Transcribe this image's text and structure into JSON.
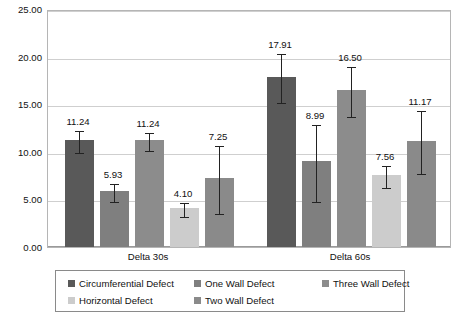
{
  "chart_data": {
    "type": "bar",
    "title": "",
    "xlabel": "",
    "ylabel": "",
    "ylim": [
      0,
      25
    ],
    "yticks": [
      "0.00",
      "5.00",
      "10.00",
      "15.00",
      "20.00",
      "25.00"
    ],
    "ytick_values": [
      0,
      5,
      10,
      15,
      20,
      25
    ],
    "grid": true,
    "legend_position": "bottom",
    "categories": [
      "Delta 30s",
      "Delta 60s"
    ],
    "series": [
      {
        "name": "Circumferential Defect",
        "color": "#595959",
        "texture": "plain",
        "values": [
          11.24,
          17.91
        ],
        "labels": [
          "11.24",
          "17.91"
        ],
        "err_low": [
          1.15,
          2.55
        ],
        "err_high": [
          1.15,
          2.55
        ]
      },
      {
        "name": "One Wall Defect",
        "color": "#7f7f7f",
        "texture": "plain",
        "values": [
          5.93,
          8.99
        ],
        "labels": [
          "5.93",
          "8.99"
        ],
        "err_low": [
          0.95,
          4.05
        ],
        "err_high": [
          0.95,
          4.05
        ]
      },
      {
        "name": "Three Wall Defect",
        "color": "#8c8c8c",
        "texture": "stripe",
        "values": [
          11.24,
          16.5
        ],
        "labels": [
          "11.24",
          "16.50"
        ],
        "err_low": [
          0.95,
          2.6
        ],
        "err_high": [
          0.95,
          2.6
        ]
      },
      {
        "name": "Horizontal Defect",
        "color": "#cccccc",
        "texture": "plain",
        "values": [
          4.1,
          7.56
        ],
        "labels": [
          "4.10",
          "7.56"
        ],
        "err_low": [
          0.7,
          1.2
        ],
        "err_high": [
          0.7,
          1.2
        ]
      },
      {
        "name": "Two Wall Defect",
        "color": "#8a8a8a",
        "texture": "plain",
        "values": [
          7.25,
          11.17
        ],
        "labels": [
          "7.25",
          "11.17"
        ],
        "err_low": [
          3.55,
          3.3
        ],
        "err_high": [
          3.55,
          3.3
        ]
      }
    ]
  },
  "legend": {
    "rows": [
      [
        "Circumferential Defect",
        "One Wall Defect",
        "Three Wall Defect"
      ],
      [
        "Horizontal Defect",
        "Two Wall Defect"
      ]
    ]
  }
}
